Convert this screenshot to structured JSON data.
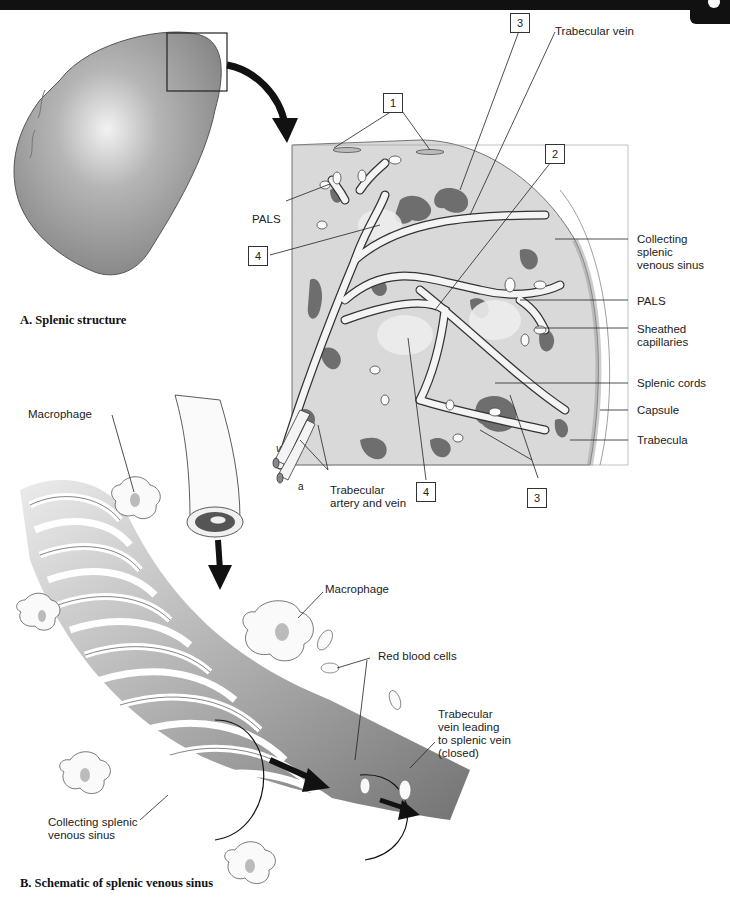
{
  "panel_a": {
    "caption": "A. Splenic structure",
    "labels": {
      "pals_left": "PALS",
      "trabecular_vein": "Trabecular vein",
      "collecting_sinus": "Collecting\nsplenic\nvenous sinus",
      "collecting_sinus_l1": "Collecting",
      "collecting_sinus_l2": "splenic",
      "collecting_sinus_l3": "venous sinus",
      "pals_right": "PALS",
      "sheathed_l1": "Sheathed",
      "sheathed_l2": "capillaries",
      "splenic_cords": "Splenic cords",
      "capsule": "Capsule",
      "trabecula": "Trabecula",
      "trab_artery_vein_l1": "Trabecular",
      "trab_artery_vein_l2": "artery and vein",
      "v": "v",
      "a": "a"
    },
    "numbered_boxes": [
      {
        "id": "box-1",
        "value": "1"
      },
      {
        "id": "box-3-top",
        "value": "3"
      },
      {
        "id": "box-2",
        "value": "2"
      },
      {
        "id": "box-4-left",
        "value": "4"
      },
      {
        "id": "box-4-bottom",
        "value": "4"
      },
      {
        "id": "box-3-bottom",
        "value": "3"
      }
    ]
  },
  "panel_b": {
    "caption": "B. Schematic of splenic venous sinus",
    "labels": {
      "macrophage_left": "Macrophage",
      "macrophage_right": "Macrophage",
      "red_blood_cells": "Red blood cells",
      "trab_vein_l1": "Trabecular",
      "trab_vein_l2": "vein leading",
      "trab_vein_l3": "to splenic vein",
      "trab_vein_l4": "(closed)",
      "collecting_l1": "Collecting splenic",
      "collecting_l2": "venous sinus"
    }
  },
  "colors": {
    "parenchyma": "#d9d9d9",
    "red_pulp": "#6e6e6e",
    "vessel": "#f4f4f4",
    "spleen": "#9a9a9a",
    "header_bar": "#111111"
  }
}
